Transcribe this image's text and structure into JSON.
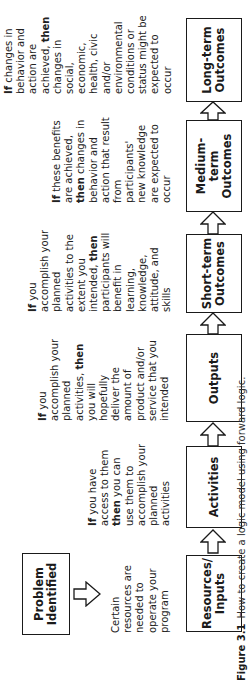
{
  "diagram": {
    "orientation": "rotated -90deg (reads bottom-to-top)",
    "problem_box": {
      "label": "Problem\nIdentified"
    },
    "steps": [
      {
        "id": "resources",
        "label": "Resources/\nInputs"
      },
      {
        "id": "activities",
        "label": "Activities"
      },
      {
        "id": "outputs",
        "label": "Outputs"
      },
      {
        "id": "short_term",
        "label": "Short-term\nOutcomes"
      },
      {
        "id": "medium_term",
        "label": "Medium-\nterm\nOutcomes"
      },
      {
        "id": "long_term",
        "label": "Long-term\nOutcomes"
      }
    ],
    "descriptions": {
      "resources": {
        "lines": [
          "Certain",
          "resources are",
          "needed to",
          "operate your",
          "program"
        ]
      },
      "activities": {
        "lines": [
          {
            "bold": "If",
            "rest": " you have"
          },
          {
            "bold": "",
            "rest": "access to them"
          },
          {
            "bold": "then",
            "rest": " you can"
          },
          {
            "bold": "",
            "rest": "use them to"
          },
          {
            "bold": "",
            "rest": "accomplish your"
          },
          {
            "bold": "",
            "rest": "planned"
          },
          {
            "bold": "",
            "rest": "activities"
          }
        ]
      },
      "outputs": {
        "lines": [
          {
            "pre": "",
            "bold": "If",
            "rest": " you"
          },
          {
            "pre": "accomplish your",
            "bold": "",
            "rest": ""
          },
          {
            "pre": "planned",
            "bold": "",
            "rest": ""
          },
          {
            "pre": "activities, ",
            "bold": "then",
            "rest": ""
          },
          {
            "pre": "you will",
            "bold": "",
            "rest": ""
          },
          {
            "pre": "hopefully",
            "bold": "",
            "rest": ""
          },
          {
            "pre": "deliver the",
            "bold": "",
            "rest": ""
          },
          {
            "pre": "amount of",
            "bold": "",
            "rest": ""
          },
          {
            "pre": "product and/or",
            "bold": "",
            "rest": ""
          },
          {
            "pre": "service that you",
            "bold": "",
            "rest": ""
          },
          {
            "pre": "intended",
            "bold": "",
            "rest": ""
          }
        ]
      },
      "short_term": {
        "lines": [
          {
            "pre": "",
            "bold": "If",
            "rest": " you"
          },
          {
            "pre": "accomplish your",
            "bold": "",
            "rest": ""
          },
          {
            "pre": "planned",
            "bold": "",
            "rest": ""
          },
          {
            "pre": "activities to the",
            "bold": "",
            "rest": ""
          },
          {
            "pre": "extent you",
            "bold": "",
            "rest": ""
          },
          {
            "pre": "intended, ",
            "bold": "then",
            "rest": ""
          },
          {
            "pre": "participants will",
            "bold": "",
            "rest": ""
          },
          {
            "pre": "benefit in",
            "bold": "",
            "rest": ""
          },
          {
            "pre": "learning,",
            "bold": "",
            "rest": ""
          },
          {
            "pre": "knowledge,",
            "bold": "",
            "rest": ""
          },
          {
            "pre": "attitude, and",
            "bold": "",
            "rest": ""
          },
          {
            "pre": "skills",
            "bold": "",
            "rest": ""
          }
        ]
      },
      "medium_term": {
        "lines": [
          {
            "pre": "",
            "bold": "If",
            "rest": " these benefits"
          },
          {
            "pre": "are achieved,",
            "bold": "",
            "rest": ""
          },
          {
            "pre": "",
            "bold": "then",
            "rest": " changes in"
          },
          {
            "pre": "behavior and",
            "bold": "",
            "rest": ""
          },
          {
            "pre": "action that result",
            "bold": "",
            "rest": ""
          },
          {
            "pre": "from",
            "bold": "",
            "rest": ""
          },
          {
            "pre": "participants'",
            "bold": "",
            "rest": ""
          },
          {
            "pre": "new knowledge",
            "bold": "",
            "rest": ""
          },
          {
            "pre": "are expected to",
            "bold": "",
            "rest": ""
          },
          {
            "pre": "occur",
            "bold": "",
            "rest": ""
          }
        ]
      },
      "long_term": {
        "lines": [
          {
            "pre": "",
            "bold": "If",
            "rest": " changes in"
          },
          {
            "pre": "behavior and",
            "bold": "",
            "rest": ""
          },
          {
            "pre": "action are",
            "bold": "",
            "rest": ""
          },
          {
            "pre": "achieved, ",
            "bold": "then",
            "rest": ""
          },
          {
            "pre": "changes in",
            "bold": "",
            "rest": ""
          },
          {
            "pre": "social,",
            "bold": "",
            "rest": ""
          },
          {
            "pre": "economic,",
            "bold": "",
            "rest": ""
          },
          {
            "pre": "health, civic",
            "bold": "",
            "rest": ""
          },
          {
            "pre": "and/or",
            "bold": "",
            "rest": ""
          },
          {
            "pre": "environmental",
            "bold": "",
            "rest": ""
          },
          {
            "pre": "conditions or",
            "bold": "",
            "rest": ""
          },
          {
            "pre": "status might be",
            "bold": "",
            "rest": ""
          },
          {
            "pre": "expected to",
            "bold": "",
            "rest": ""
          },
          {
            "pre": "occur",
            "bold": "",
            "rest": ""
          }
        ]
      }
    },
    "arrows": [
      {
        "from": "problem_box",
        "to": "resources_description",
        "icon": "hollow-arrow-down-icon"
      },
      {
        "from": "resources",
        "to": "activities",
        "icon": "hollow-arrow-right-icon"
      },
      {
        "from": "activities",
        "to": "outputs",
        "icon": "hollow-arrow-right-icon"
      },
      {
        "from": "outputs",
        "to": "short_term",
        "icon": "hollow-arrow-right-icon"
      },
      {
        "from": "short_term",
        "to": "medium_term",
        "icon": "hollow-arrow-right-icon"
      },
      {
        "from": "medium_term",
        "to": "long_term",
        "icon": "hollow-arrow-right-icon"
      }
    ]
  },
  "caption": {
    "number": "Figure 3.1",
    "text": "How to create a logic model using forward logic."
  }
}
